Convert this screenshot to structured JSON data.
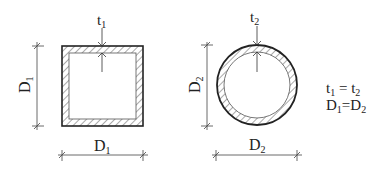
{
  "diagram": {
    "type": "cross-section comparison",
    "colors": {
      "line": "#222222",
      "hatch": "#555555",
      "dim_line": "#444444",
      "background": "#ffffff"
    },
    "square_section": {
      "shape": "square hollow section",
      "thickness_label": "t",
      "thickness_sub": "1",
      "height_label": "D",
      "height_sub": "1",
      "width_label": "D",
      "width_sub": "1"
    },
    "circular_section": {
      "shape": "circular hollow section",
      "thickness_label": "t",
      "thickness_sub": "2",
      "height_label": "D",
      "height_sub": "2",
      "width_label": "D",
      "width_sub": "2"
    },
    "equations": [
      {
        "left": "t",
        "left_sub": "1",
        "op": " = ",
        "right": "t",
        "right_sub": "2"
      },
      {
        "left": "D",
        "left_sub": "1",
        "op": "=",
        "right": "D",
        "right_sub": "2"
      }
    ]
  }
}
